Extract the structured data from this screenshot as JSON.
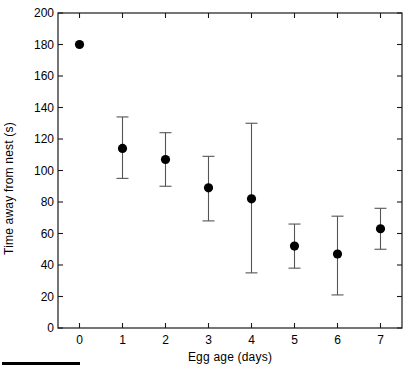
{
  "figure": {
    "background_color": "#ffffff",
    "ink_color": "#000000",
    "scalebar_present": true
  },
  "chart_data": {
    "type": "scatter",
    "title": "",
    "xlabel": "Egg age (days)",
    "ylabel": "Time away from nest (s)",
    "xlim": [
      -0.5,
      7.5
    ],
    "ylim": [
      0,
      200
    ],
    "grid": false,
    "legend": null,
    "x": [
      0,
      1,
      2,
      3,
      4,
      5,
      6,
      7
    ],
    "categories": [
      "0",
      "1",
      "2",
      "3",
      "4",
      "5",
      "6",
      "7"
    ],
    "values": [
      180,
      114,
      107,
      89,
      82,
      52,
      47,
      63
    ],
    "error_upper": [
      180,
      134,
      124,
      109,
      130,
      66,
      71,
      76
    ],
    "error_lower": [
      180,
      95,
      90,
      68,
      35,
      38,
      21,
      50
    ],
    "xticks": [
      0,
      1,
      2,
      3,
      4,
      5,
      6,
      7
    ],
    "xtick_labels": [
      "0",
      "1",
      "2",
      "3",
      "4",
      "5",
      "6",
      "7"
    ],
    "yticks": [
      0,
      20,
      40,
      60,
      80,
      100,
      120,
      140,
      160,
      180,
      200
    ],
    "ytick_labels": [
      "0",
      "20",
      "40",
      "60",
      "80",
      "100",
      "120",
      "140",
      "160",
      "180",
      "200"
    ],
    "marker": "filled-circle",
    "marker_color": "#000000",
    "errorbar_color": "#555555",
    "series": [
      {
        "name": "Time away from nest",
        "values": [
          180,
          114,
          107,
          89,
          82,
          52,
          47,
          63
        ]
      }
    ]
  }
}
